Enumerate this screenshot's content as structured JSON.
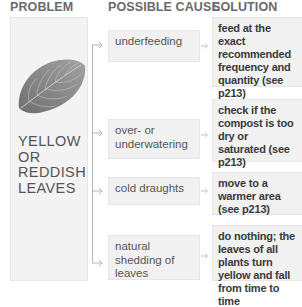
{
  "headers": {
    "problem": "PROBLEM",
    "cause": "POSSIBLE CAUSE",
    "solution": "SOLUTION"
  },
  "problem": {
    "image": "leaf-icon",
    "lines": [
      "YELLOW",
      "OR",
      "REDDISH",
      "LEAVES"
    ]
  },
  "rows": [
    {
      "cause": "underfeeding",
      "solution": "feed at the exact recommended frequency and quantity (see p213)"
    },
    {
      "cause": "over- or underwatering",
      "solution": "check if the compost is too dry or saturated (see p213)"
    },
    {
      "cause": "cold draughts",
      "solution": "move to a warmer area (see p213)"
    },
    {
      "cause": "natural shedding of leaves",
      "solution": "do nothing; the leaves of all plants turn yellow and fall from time to time"
    }
  ],
  "colors": {
    "box_fill": "#f1f1f1",
    "header_text": "#6a6a6a",
    "connector": "#b5b5b5",
    "leaf": "#8a8a8a"
  }
}
